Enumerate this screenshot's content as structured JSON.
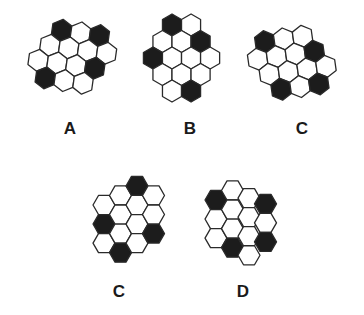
{
  "colors": {
    "filled": "#1c1c1c",
    "empty": "#ffffff",
    "stroke": "#2a2a2a"
  },
  "figures": [
    {
      "id": "A",
      "label": "A",
      "label_pos": [
        70,
        129
      ],
      "orientation": "pointy",
      "radius": 11,
      "rotate": 8,
      "origin": [
        58,
        32
      ],
      "rows": [
        {
          "offset": 0,
          "cells": [
            1,
            0,
            1
          ]
        },
        {
          "offset": -0.5,
          "cells": [
            0,
            0,
            0,
            0
          ]
        },
        {
          "offset": -1,
          "cells": [
            0,
            0,
            0,
            1
          ]
        },
        {
          "offset": -0.5,
          "cells": [
            1,
            0,
            0
          ]
        }
      ]
    },
    {
      "id": "B",
      "label": "B",
      "label_pos": [
        190,
        129
      ],
      "orientation": "pointy",
      "radius": 11,
      "rotate": 0,
      "origin": [
        172,
        25
      ],
      "rows": [
        {
          "offset": 0,
          "cells": [
            1,
            0
          ]
        },
        {
          "offset": -0.5,
          "cells": [
            0,
            0,
            1
          ]
        },
        {
          "offset": -1,
          "cells": [
            1,
            0,
            0,
            0
          ]
        },
        {
          "offset": -0.5,
          "cells": [
            0,
            0,
            0
          ]
        },
        {
          "offset": 0,
          "cells": [
            0,
            1
          ]
        }
      ]
    },
    {
      "id": "C1",
      "label": "C",
      "label_pos": [
        302,
        129
      ],
      "orientation": "pointy",
      "radius": 11,
      "rotate": -8,
      "origin": [
        268,
        38
      ],
      "rows": [
        {
          "offset": 0,
          "cells": [
            1,
            0,
            0
          ]
        },
        {
          "offset": -0.5,
          "cells": [
            0,
            0,
            0,
            1
          ]
        },
        {
          "offset": 0,
          "cells": [
            0,
            0,
            0,
            0
          ]
        },
        {
          "offset": 0.5,
          "cells": [
            1,
            0,
            1
          ]
        }
      ]
    },
    {
      "id": "C2",
      "label": "C",
      "label_pos": [
        119,
        292
      ],
      "orientation": "flat",
      "radius": 11,
      "rotate": 0,
      "origin": [
        104,
        205
      ],
      "cols": [
        {
          "offset": 0,
          "cells": [
            0,
            1,
            0
          ]
        },
        {
          "offset": -0.5,
          "cells": [
            0,
            0,
            0,
            1
          ]
        },
        {
          "offset": -1,
          "cells": [
            1,
            0,
            0,
            0
          ]
        },
        {
          "offset": -0.5,
          "cells": [
            0,
            0,
            1
          ]
        }
      ]
    },
    {
      "id": "D",
      "label": "D",
      "label_pos": [
        243,
        292
      ],
      "orientation": "flat",
      "radius": 11,
      "rotate": 0,
      "origin": [
        216,
        200
      ],
      "cols": [
        {
          "offset": 0,
          "cells": [
            1,
            0,
            0
          ]
        },
        {
          "offset": -0.5,
          "cells": [
            0,
            0,
            0,
            1
          ]
        },
        {
          "offset": -0.1,
          "cells": [
            0,
            0,
            0,
            0
          ]
        },
        {
          "offset": 0.2,
          "cells": [
            1,
            0,
            1
          ]
        }
      ]
    }
  ],
  "labels": {
    "a": "A",
    "b": "B",
    "c_top": "C",
    "c_bottom": "C",
    "d": "D"
  }
}
